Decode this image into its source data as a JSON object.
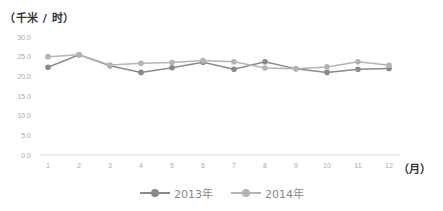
{
  "chart_data": {
    "type": "line",
    "title": "",
    "ylabel": "（千米/时）",
    "xlabel": "（月）",
    "ylim": [
      0,
      30
    ],
    "yticks": [
      "0.0",
      "5.0",
      "10.0",
      "15.0",
      "20.0",
      "25.0",
      "30.0"
    ],
    "categories": [
      "1",
      "2",
      "3",
      "4",
      "5",
      "6",
      "7",
      "8",
      "9",
      "10",
      "11",
      "12"
    ],
    "grid": false,
    "legend_position": "bottom",
    "series": [
      {
        "name": "2013年",
        "color": "#8a8a8a",
        "values": [
          22.3,
          25.5,
          22.7,
          21.0,
          22.2,
          23.6,
          21.8,
          23.7,
          21.9,
          21.0,
          21.8,
          22.0
        ]
      },
      {
        "name": "2014年",
        "color": "#b4b4b4",
        "values": [
          25.0,
          25.5,
          22.9,
          23.3,
          23.5,
          24.0,
          23.7,
          22.1,
          21.9,
          22.4,
          23.7,
          22.8
        ]
      }
    ]
  },
  "labels": {
    "unit_title": "（千米 / 时）",
    "x_unit": "（月）"
  },
  "legend": [
    {
      "label": "2013年",
      "color": "#8a8a8a"
    },
    {
      "label": "2014年",
      "color": "#b4b4b4"
    }
  ]
}
